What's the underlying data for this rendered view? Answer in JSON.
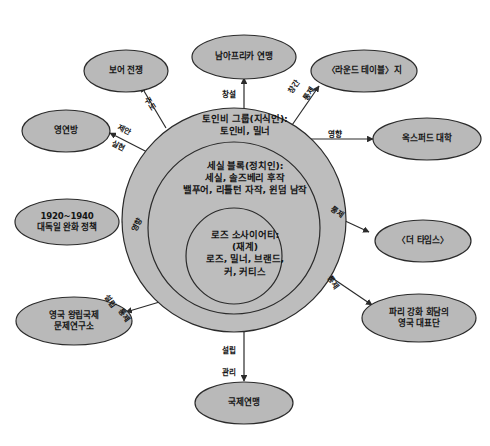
{
  "diagram": {
    "type": "concentric-network-diagram",
    "colors": {
      "node_fill": "#b9b9b9",
      "ring_outer_fill": "#bdbdbd",
      "ring_middle_fill": "#bdbdbd",
      "ring_inner_fill": "#bdbdbd",
      "stroke": "#2b2b2b",
      "background": "#ffffff",
      "text": "#141414"
    },
    "rings": [
      {
        "id": "ring-outer",
        "name": "toynbee-group",
        "title": "토인비 그룹(지식인):",
        "members": "토인비, 밀너"
      },
      {
        "id": "ring-middle",
        "name": "cecil-bloc",
        "title": "세실 블록(정치인):",
        "members_line1": "세실, 솔즈베리 후작",
        "members_line2": "밸푸어, 리틀턴 자작, 윈덤 남작"
      },
      {
        "id": "ring-inner",
        "name": "rhodes-society",
        "title": "로즈 소사이어티:",
        "subtitle": "(재계)",
        "members_line1": "로즈, 밀너, 브랜드,",
        "members_line2": "커, 커티스"
      }
    ],
    "nodes": [
      {
        "id": "node-south-africa-union",
        "label_line1": "남아프리카 연맹",
        "label_line2": ""
      },
      {
        "id": "node-boer-war",
        "label_line1": "보어 전쟁",
        "label_line2": ""
      },
      {
        "id": "node-round-table",
        "label_line1": "〈라운드 테이블〉지",
        "label_line2": ""
      },
      {
        "id": "node-commonwealth",
        "label_line1": "영연방",
        "label_line2": ""
      },
      {
        "id": "node-oxford-university",
        "label_line1": "옥스퍼드 대학",
        "label_line2": ""
      },
      {
        "id": "node-appeasement-policy",
        "label_line1": "1920~1940",
        "label_line2": "대독일 완화 정책"
      },
      {
        "id": "node-the-times",
        "label_line1": "〈더 타임스〉",
        "label_line2": ""
      },
      {
        "id": "node-chatham-house",
        "label_line1": "영국 왕립국제",
        "label_line2": "문제연구소"
      },
      {
        "id": "node-paris-delegation",
        "label_line1": "파리 강화 회담의",
        "label_line2": "영국 대표단"
      },
      {
        "id": "node-league-of-nations",
        "label_line1": "국제연맹",
        "label_line2": ""
      }
    ],
    "edges": [
      {
        "id": "edge-south-africa-union",
        "target": "node-south-africa-union",
        "labels": [
          "창설"
        ]
      },
      {
        "id": "edge-boer-war",
        "target": "node-boer-war",
        "labels": [
          "주도"
        ]
      },
      {
        "id": "edge-round-table",
        "target": "node-round-table",
        "labels": [
          "창간",
          "통제"
        ]
      },
      {
        "id": "edge-commonwealth",
        "target": "node-commonwealth",
        "labels": [
          "제안",
          "실현"
        ]
      },
      {
        "id": "edge-oxford-university",
        "target": "node-oxford-university",
        "labels": [
          "영향"
        ]
      },
      {
        "id": "edge-appeasement-policy",
        "target": "node-appeasement-policy",
        "labels": [
          "영향"
        ]
      },
      {
        "id": "edge-the-times",
        "target": "node-the-times",
        "labels": [
          "통제"
        ]
      },
      {
        "id": "edge-chatham-house",
        "target": "node-chatham-house",
        "labels": [
          "설립",
          "통제"
        ]
      },
      {
        "id": "edge-paris-delegation",
        "target": "node-paris-delegation",
        "labels": [
          "통제"
        ]
      },
      {
        "id": "edge-league-of-nations",
        "target": "node-league-of-nations",
        "labels": [
          "설립",
          "관리"
        ]
      }
    ]
  }
}
